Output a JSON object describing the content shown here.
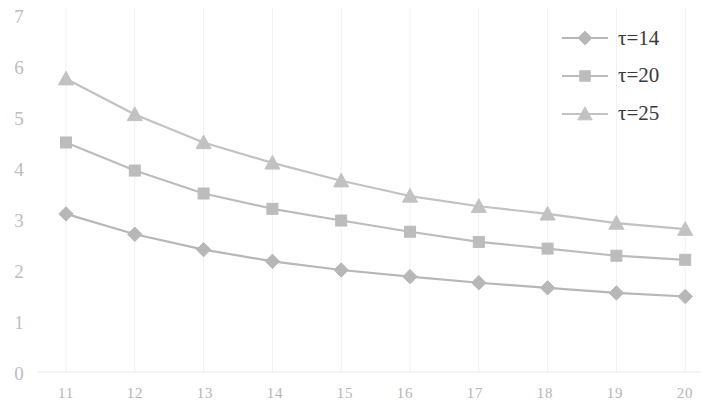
{
  "chart_data": {
    "type": "line",
    "title": "",
    "subtitle": "",
    "xlabel": "",
    "ylabel": "",
    "x": [
      11,
      12,
      13,
      14,
      15,
      16,
      17,
      18,
      19,
      20
    ],
    "xtick_labels": [
      "11",
      "12",
      "13",
      "14",
      "15",
      "16",
      "17",
      "18",
      "19",
      "20"
    ],
    "ytick_labels": [
      "0",
      "1",
      "2",
      "3",
      "4",
      "5",
      "6",
      "7"
    ],
    "ytick_values": [
      0,
      1,
      2,
      3,
      4,
      5,
      6,
      7
    ],
    "xlim": [
      10.6,
      20.25
    ],
    "ylim": [
      0,
      7
    ],
    "grid": "vertical-faint",
    "legend_position": "top-right",
    "series": [
      {
        "name": "τ=14",
        "marker": "diamond",
        "color": "#b7b7b7",
        "values": [
          3.1,
          2.7,
          2.4,
          2.17,
          2.0,
          1.87,
          1.75,
          1.65,
          1.55,
          1.48
        ]
      },
      {
        "name": "τ=20",
        "marker": "square",
        "color": "#bcbcbc",
        "values": [
          4.5,
          3.95,
          3.5,
          3.2,
          2.97,
          2.75,
          2.55,
          2.42,
          2.28,
          2.2
        ]
      },
      {
        "name": "τ=25",
        "marker": "triangle",
        "color": "#c2c2c2",
        "values": [
          5.75,
          5.05,
          4.5,
          4.1,
          3.75,
          3.45,
          3.25,
          3.1,
          2.92,
          2.8
        ]
      }
    ]
  },
  "legend": {
    "entries": [
      {
        "label": "τ=14",
        "marker": "diamond"
      },
      {
        "label": "τ=20",
        "marker": "square"
      },
      {
        "label": "τ=25",
        "marker": "triangle"
      }
    ]
  },
  "axes": {
    "y_labels": [
      "7",
      "6",
      "5",
      "4",
      "3",
      "2",
      "1",
      "0"
    ],
    "x_labels": [
      "11",
      "12",
      "13",
      "14",
      "15",
      "16",
      "17",
      "18",
      "19",
      "20"
    ]
  },
  "colors": {
    "series_gray": "#bbbbbb",
    "tick_text": "#bdbdbd",
    "legend_text": "#3a3a3a",
    "gridline": "#f0f0f0",
    "background": "#ffffff"
  }
}
